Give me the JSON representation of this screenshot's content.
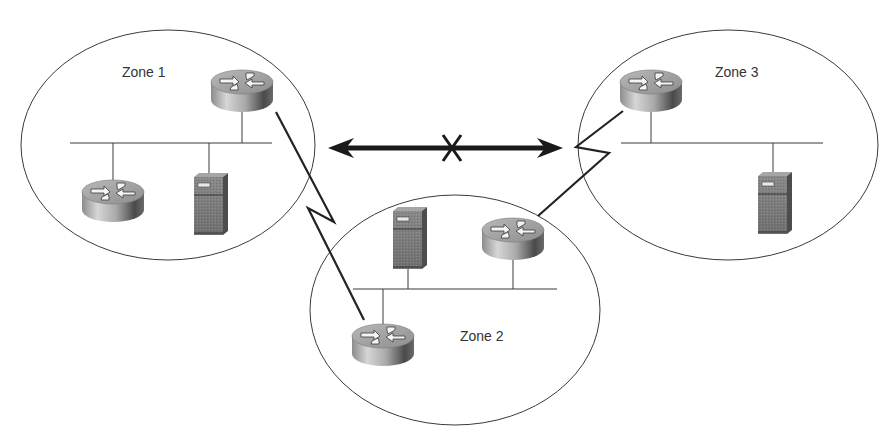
{
  "diagram": {
    "type": "network-topology",
    "background": "#ffffff",
    "stroke_color": "#3a3a3a",
    "link_color": "#222222"
  },
  "zones": [
    {
      "id": "zone1",
      "label": "Zone 1",
      "ellipse": {
        "cx": 168,
        "cy": 145,
        "rx": 147,
        "ry": 115
      },
      "label_pos": {
        "x": 122,
        "y": 73
      },
      "lan": {
        "x1": 70,
        "x2": 272,
        "y": 143
      },
      "devices": [
        {
          "type": "router",
          "name": "zone1-border-router",
          "x": 242,
          "y": 91,
          "drop_to_lan": true
        },
        {
          "type": "router",
          "name": "zone1-internal-router",
          "x": 113,
          "y": 201,
          "drop_to_lan": true
        },
        {
          "type": "server",
          "name": "zone1-server",
          "x": 211,
          "y": 202,
          "drop_to_lan": true
        }
      ]
    },
    {
      "id": "zone2",
      "label": "Zone 2",
      "ellipse": {
        "cx": 455,
        "cy": 310,
        "rx": 145,
        "ry": 115
      },
      "label_pos": {
        "x": 460,
        "y": 337
      },
      "lan": {
        "x1": 353,
        "x2": 557,
        "y": 289
      },
      "devices": [
        {
          "type": "server",
          "name": "zone2-server",
          "x": 410,
          "y": 236,
          "drop_to_lan": true
        },
        {
          "type": "router",
          "name": "zone2-router-to-zone3",
          "x": 513,
          "y": 239,
          "drop_to_lan": true
        },
        {
          "type": "router",
          "name": "zone2-router-to-zone1",
          "x": 383,
          "y": 345,
          "drop_to_lan": true
        }
      ]
    },
    {
      "id": "zone3",
      "label": "Zone 3",
      "ellipse": {
        "cx": 728,
        "cy": 145,
        "rx": 150,
        "ry": 115
      },
      "label_pos": {
        "x": 715,
        "y": 73
      },
      "lan": {
        "x1": 621,
        "x2": 823,
        "y": 143
      },
      "devices": [
        {
          "type": "router",
          "name": "zone3-border-router",
          "x": 651,
          "y": 91,
          "drop_to_lan": true
        },
        {
          "type": "server",
          "name": "zone3-server",
          "x": 775,
          "y": 201,
          "drop_to_lan": true
        }
      ]
    }
  ],
  "links": [
    {
      "name": "serial-link-zone1-zone2",
      "type": "serial",
      "points": [
        [
          276,
          112
        ],
        [
          334,
          222
        ],
        [
          308,
          208
        ],
        [
          364,
          320
        ]
      ]
    },
    {
      "name": "serial-link-zone3-zone2",
      "type": "serial",
      "points": [
        [
          623,
          111
        ],
        [
          576,
          147
        ],
        [
          609,
          153
        ],
        [
          538,
          216
        ]
      ]
    }
  ],
  "blocked_path": {
    "name": "blocked-direct-path-zone1-zone3",
    "x1": 328,
    "x2": 563,
    "y": 148,
    "mark": "X",
    "mark_x": 452,
    "meaning": "No direct connection between Zone 1 and Zone 3"
  }
}
